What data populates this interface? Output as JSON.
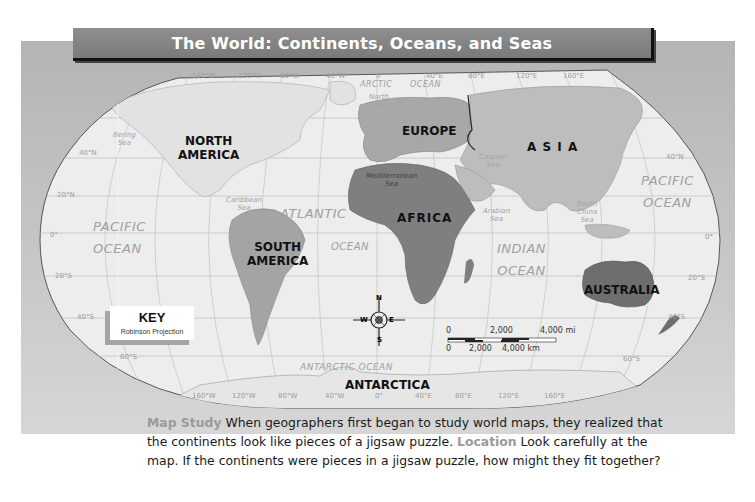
{
  "title": "The World: Continents, Oceans, and Seas",
  "map": {
    "continents": {
      "north_america": [
        "NORTH",
        "AMERICA"
      ],
      "south_america": [
        "SOUTH",
        "AMERICA"
      ],
      "europe": "EUROPE",
      "asia": "A S I A",
      "africa": "AFRICA",
      "australia": "AUSTRALIA",
      "antarctica": "ANTARCTICA"
    },
    "oceans": {
      "pacific_west": [
        "PACIFIC",
        "OCEAN"
      ],
      "pacific_east": [
        "PACIFIC",
        "OCEAN"
      ],
      "atlantic": [
        "ATLANTIC",
        "OCEAN"
      ],
      "indian": [
        "INDIAN",
        "OCEAN"
      ],
      "arctic": [
        "ARCTIC",
        "OCEAN"
      ],
      "antarctic": "ANTARCTIC OCEAN"
    },
    "seas": {
      "bering": [
        "Bering",
        "Sea"
      ],
      "north": [
        "North",
        "Sea"
      ],
      "black": "Black Sea",
      "caspian": [
        "Caspian",
        "Sea"
      ],
      "mediterranean": [
        "Mediterranean",
        "Sea"
      ],
      "caribbean": [
        "Caribbean",
        "Sea"
      ],
      "arabian": [
        "Arabian",
        "Sea"
      ],
      "south_china": [
        "South",
        "China",
        "Sea"
      ]
    },
    "graticule": {
      "longitudes": [
        "160°W",
        "120°W",
        "80°W",
        "40°W",
        "0°",
        "40°E",
        "80°E",
        "120°E",
        "160°E"
      ],
      "latitudes_left": [
        "40°N",
        "20°N",
        "0°",
        "20°S",
        "40°S",
        "60°S"
      ],
      "latitudes_right": [
        "40°N",
        "0°",
        "20°S",
        "40°S",
        "60°S"
      ]
    },
    "compass": {
      "n": "N",
      "s": "S",
      "e": "E",
      "w": "W"
    },
    "scale": {
      "mi_labels": [
        "0",
        "2,000",
        "4,000 mi"
      ],
      "km_labels": [
        "0",
        "2,000",
        "4,000 km"
      ]
    }
  },
  "key": {
    "title": "KEY",
    "projection": "Robinson Projection"
  },
  "caption": {
    "label1": "Map Study",
    "text1": " When geographers first began to study world maps, they realized that the continents look like pieces of a jigsaw puzzle. ",
    "label2": "Location",
    "text2": " Look carefully at the map. If the continents were pieces in a jigsaw puzzle, how might they fit together?"
  },
  "colors": {
    "panel": "#c0c0c0",
    "ocean": "#ececec",
    "land_light": "#c4c4c4",
    "land_mid": "#a8a8a8",
    "land_dark": "#7e7e7e",
    "title_bar": "#858585"
  }
}
